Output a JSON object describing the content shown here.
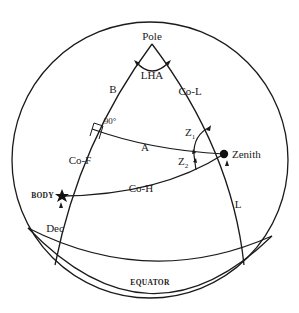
{
  "diagram": {
    "type": "celestial-navigational-triangle",
    "labels": {
      "pole": "Pole",
      "lha": "LHA",
      "b": "B",
      "co_l": "Co-L",
      "right_angle": "90°",
      "a": "A",
      "z1": "Z",
      "z1_sub": "1",
      "z2": "Z",
      "z2_sub": "2",
      "zenith": "Zenith",
      "co_f": "Co-F",
      "co_h": "Co-H",
      "body": "BODY",
      "dec": "Dec",
      "l": "L",
      "equator": "EQUATOR"
    },
    "points": [
      "Pole",
      "Zenith",
      "BODY"
    ],
    "colors": {
      "line": "#1a1a1a",
      "background": "#ffffff"
    }
  }
}
